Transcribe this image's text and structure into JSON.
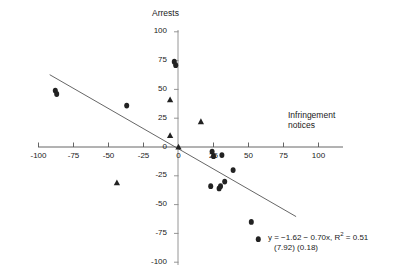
{
  "chart_data": {
    "type": "scatter",
    "title": "",
    "ylabel": "Arrests",
    "xlabel": "Infringement notices",
    "xlim": [
      -100,
      100
    ],
    "ylim": [
      -100,
      100
    ],
    "xticks": [
      -100,
      -75,
      -50,
      -25,
      0,
      25,
      50,
      75,
      100
    ],
    "yticks": [
      -100,
      -75,
      -50,
      -25,
      0,
      25,
      50,
      75,
      100
    ],
    "xtick_labels": [
      "-100",
      "-75",
      "-50",
      "-25",
      "0",
      "25",
      "50",
      "75",
      "100"
    ],
    "ytick_labels": [
      "-100",
      "-75",
      "-50",
      "-25",
      "0",
      "25",
      "50",
      "75",
      "100"
    ],
    "grid": false,
    "legend": "none",
    "axes_style": "crossed-at-origin",
    "series": [
      {
        "name": "diamond-points",
        "marker": "diamond",
        "color": "#222222",
        "points": [
          {
            "x": -88,
            "y": 49
          },
          {
            "x": -87,
            "y": 46
          },
          {
            "x": -37,
            "y": 36
          },
          {
            "x": -3,
            "y": 74
          },
          {
            "x": -2,
            "y": 71
          },
          {
            "x": 24,
            "y": -4
          },
          {
            "x": 25,
            "y": -8
          },
          {
            "x": 31,
            "y": -7
          },
          {
            "x": 39,
            "y": -20
          },
          {
            "x": 23,
            "y": -34
          },
          {
            "x": 29,
            "y": -36
          },
          {
            "x": 30,
            "y": -34
          },
          {
            "x": 33,
            "y": -30
          },
          {
            "x": 52,
            "y": -65
          },
          {
            "x": 57,
            "y": -80
          }
        ]
      },
      {
        "name": "triangle-points",
        "marker": "triangle",
        "color": "#222222",
        "points": [
          {
            "x": -6,
            "y": 41
          },
          {
            "x": 16,
            "y": 22
          },
          {
            "x": -6,
            "y": 10
          },
          {
            "x": 0,
            "y": 0
          },
          {
            "x": -44,
            "y": -31
          }
        ]
      }
    ],
    "trendline": {
      "name": "fitted-regression-line",
      "intercept": -1.62,
      "slope": -0.7,
      "color": "#555555",
      "x_start": -92,
      "x_end": 84
    },
    "annotation": {
      "equation_prefix": "y = −1.62 − 0.70x, R",
      "equation_exponent": "2",
      "equation_suffix": " = 0.51",
      "std_errors": "(7.92)  (0.18)"
    }
  }
}
